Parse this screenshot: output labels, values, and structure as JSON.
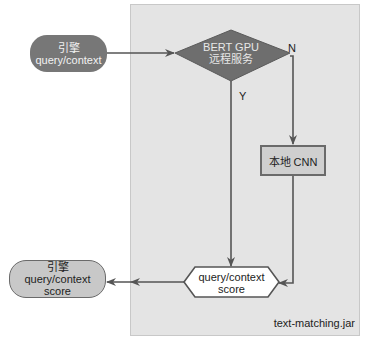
{
  "diagram": {
    "container_label": "text-matching.jar",
    "start_node": {
      "line1": "引擎",
      "line2": "query/context"
    },
    "decision_node": {
      "line1": "BERT GPU",
      "line2": "远程服务"
    },
    "yes_label": "Y",
    "no_label": "N",
    "fallback_node": {
      "label": "本地 CNN"
    },
    "result_node": {
      "line1": "query/context",
      "line2": "score"
    },
    "end_node": {
      "line1": "引擎",
      "line2": "query/context",
      "line3": "score"
    },
    "colors": {
      "panel": "#e4e4e4",
      "start_fill": "#777777",
      "decision_fill": "#6e6e6e",
      "box_fill": "#cfcfcf",
      "line": "#555555"
    }
  }
}
